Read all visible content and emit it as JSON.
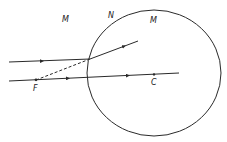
{
  "diagram": {
    "labels": {
      "medium_left": "M",
      "interface": "N",
      "medium_right": "M",
      "focal_point": "F",
      "center": "C"
    },
    "colors": {
      "stroke": "#2a2a2a",
      "background": "#ffffff"
    }
  }
}
